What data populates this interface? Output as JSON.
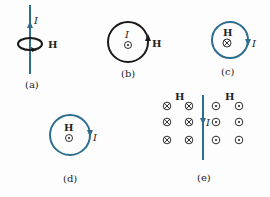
{
  "colors": {
    "wire": "#2e6e8e",
    "black": "#1a1a1a",
    "text": "#222222"
  },
  "panels": {
    "a": {
      "label": "(a)",
      "current": "I",
      "field": "H"
    },
    "b": {
      "label": "(b)",
      "current": "I",
      "field": "H",
      "center_symbol": "dot-out-of-page"
    },
    "c": {
      "label": "(c)",
      "current": "I",
      "field": "H",
      "center_symbol": "cross-into-page"
    },
    "d": {
      "label": "(d)",
      "current": "I",
      "field": "H",
      "center_symbol": "dot-out-of-page"
    },
    "e": {
      "label": "(e)",
      "current": "I",
      "field_left": "H",
      "field_right": "H",
      "left_symbols": "cross-into-page (3 rows x 2 cols)",
      "right_symbols": "dot-out-of-page (3 rows x 2 cols)"
    }
  }
}
